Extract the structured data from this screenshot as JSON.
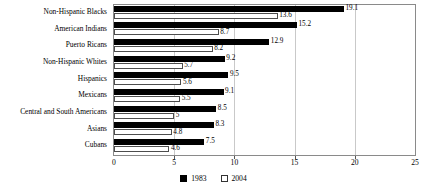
{
  "chart_data": {
    "type": "bar",
    "orientation": "horizontal",
    "title": "",
    "subtitle": "",
    "xlabel": "",
    "ylabel": "",
    "xlim": [
      0,
      25
    ],
    "xticks": [
      0,
      5,
      10,
      15,
      20,
      25
    ],
    "xtick_labels": [
      "0",
      "5",
      "10",
      "15",
      "20",
      "25"
    ],
    "grid": true,
    "legend_position": "bottom-center",
    "categories": [
      "Non-Hispanic Blacks",
      "American Indians",
      "Puerto Ricans",
      "Non-Hispanic Whites",
      "Hispanics",
      "Mexicans",
      "Central and South Americans",
      "Asians",
      "Cubans"
    ],
    "series": [
      {
        "name": "1983",
        "color": "#000000",
        "values": [
          19.1,
          15.2,
          12.9,
          9.2,
          9.5,
          9.1,
          8.5,
          8.3,
          7.5
        ],
        "value_labels": [
          "19.1",
          "15.2",
          "12.9",
          "9.2",
          "9.5",
          "9.1",
          "8.5",
          "8.3",
          "7.5"
        ]
      },
      {
        "name": "2004",
        "color": "#ffffff",
        "values": [
          13.6,
          8.7,
          8.2,
          5.7,
          5.6,
          5.5,
          5.0,
          4.8,
          4.6
        ],
        "value_labels": [
          "13.6",
          "8.7",
          "8.2",
          "5.7",
          "5.6",
          "5.5",
          "5",
          "4.8",
          "4.6"
        ]
      }
    ]
  },
  "legend": {
    "items": [
      {
        "label": "1983",
        "swatch": "filled-black-square"
      },
      {
        "label": "2004",
        "swatch": "open-white-square"
      }
    ]
  }
}
